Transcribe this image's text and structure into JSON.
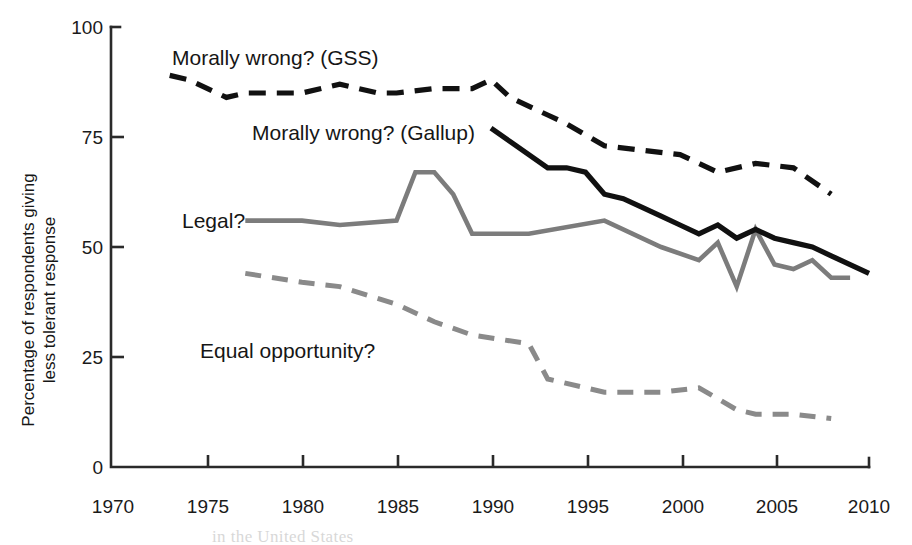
{
  "figure": {
    "ylabel_line1": "Percentage of respondents giving",
    "ylabel_line2": "less tolerant response",
    "y_ticks": [
      "100",
      "75",
      "50",
      "25",
      "0"
    ],
    "x_ticks": [
      "1970",
      "1975",
      "1980",
      "1985",
      "1990",
      "1995",
      "2000",
      "2005",
      "2010"
    ],
    "annotations": {
      "gss": "Morally wrong? (GSS)",
      "gallup": "Morally wrong? (Gallup)",
      "legal": "Legal?",
      "equal": "Equal opportunity?"
    },
    "caption_fragment": "in the United States",
    "colors": {
      "gss": "#111111",
      "gallup": "#111111",
      "legal": "#7c7c7c",
      "equal": "#8a8a8a",
      "axis": "#2a2a2a",
      "background": "#ffffff"
    }
  },
  "chart_data": {
    "type": "line",
    "title": "",
    "xlabel": "",
    "ylabel": "Percentage of respondents giving less tolerant response",
    "xlim": [
      1970,
      2010
    ],
    "ylim": [
      0,
      100
    ],
    "xticks": [
      1970,
      1975,
      1980,
      1985,
      1990,
      1995,
      2000,
      2005,
      2010
    ],
    "yticks": [
      0,
      25,
      50,
      75,
      100
    ],
    "grid": false,
    "legend": "inline-annotations",
    "series": [
      {
        "name": "Morally wrong? (GSS)",
        "style": "dashed",
        "color": "#111111",
        "x": [
          1973,
          1974,
          1976,
          1977,
          1980,
          1982,
          1984,
          1985,
          1987,
          1988,
          1989,
          1990,
          1991,
          1993,
          1994,
          1996,
          1998,
          2000,
          2002,
          2004,
          2006,
          2008
        ],
        "y": [
          89,
          88,
          84,
          85,
          85,
          87,
          85,
          85,
          86,
          86,
          86,
          88,
          84,
          80,
          78,
          73,
          72,
          71,
          67,
          69,
          68,
          62
        ]
      },
      {
        "name": "Morally wrong? (Gallup)",
        "style": "solid",
        "color": "#111111",
        "x": [
          1990,
          1991,
          1992,
          1993,
          1994,
          1995,
          1996,
          1997,
          1998,
          1999,
          2000,
          2001,
          2002,
          2003,
          2004,
          2005,
          2006,
          2007,
          2008,
          2009,
          2010
        ],
        "y": [
          77,
          74,
          71,
          68,
          68,
          67,
          62,
          61,
          59,
          57,
          55,
          53,
          55,
          52,
          54,
          52,
          51,
          50,
          48,
          46,
          44
        ]
      },
      {
        "name": "Legal?",
        "style": "solid",
        "color": "#7c7c7c",
        "x": [
          1977,
          1980,
          1982,
          1985,
          1986,
          1987,
          1988,
          1989,
          1992,
          1996,
          1999,
          2001,
          2002,
          2003,
          2004,
          2005,
          2006,
          2007,
          2008,
          2009
        ],
        "y": [
          56,
          56,
          55,
          56,
          67,
          67,
          62,
          53,
          53,
          56,
          50,
          47,
          51,
          41,
          54,
          46,
          45,
          47,
          43,
          43
        ]
      },
      {
        "name": "Equal opportunity?",
        "style": "dashed",
        "color": "#8a8a8a",
        "x": [
          1977,
          1980,
          1982,
          1985,
          1987,
          1989,
          1992,
          1993,
          1996,
          1999,
          2001,
          2003,
          2004,
          2006,
          2008
        ],
        "y": [
          44,
          42,
          41,
          37,
          33,
          30,
          28,
          20,
          17,
          17,
          18,
          13,
          12,
          12,
          11
        ]
      }
    ]
  }
}
